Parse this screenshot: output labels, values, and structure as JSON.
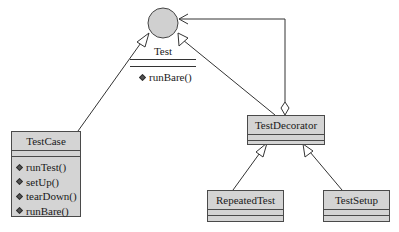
{
  "diagram": {
    "type": "UML class diagram",
    "interface": {
      "name": "Test",
      "methods": [
        "runBare()"
      ]
    },
    "classes": [
      {
        "name": "TestCase",
        "methods": [
          "runTest()",
          "setUp()",
          "tearDown()",
          "runBare()"
        ]
      },
      {
        "name": "TestDecorator",
        "methods": []
      },
      {
        "name": "RepeatedTest",
        "methods": []
      },
      {
        "name": "TestSetup",
        "methods": []
      }
    ],
    "relations": [
      {
        "from": "TestCase",
        "to": "Test",
        "kind": "realization"
      },
      {
        "from": "TestDecorator",
        "to": "Test",
        "kind": "realization"
      },
      {
        "from": "TestDecorator",
        "to": "Test",
        "kind": "aggregation"
      },
      {
        "from": "RepeatedTest",
        "to": "TestDecorator",
        "kind": "inheritance"
      },
      {
        "from": "TestSetup",
        "to": "TestDecorator",
        "kind": "inheritance"
      }
    ],
    "colors": {
      "box_fill": "#d4d4d4",
      "circle_fill": "#d0d0d0",
      "line": "#333333"
    }
  }
}
